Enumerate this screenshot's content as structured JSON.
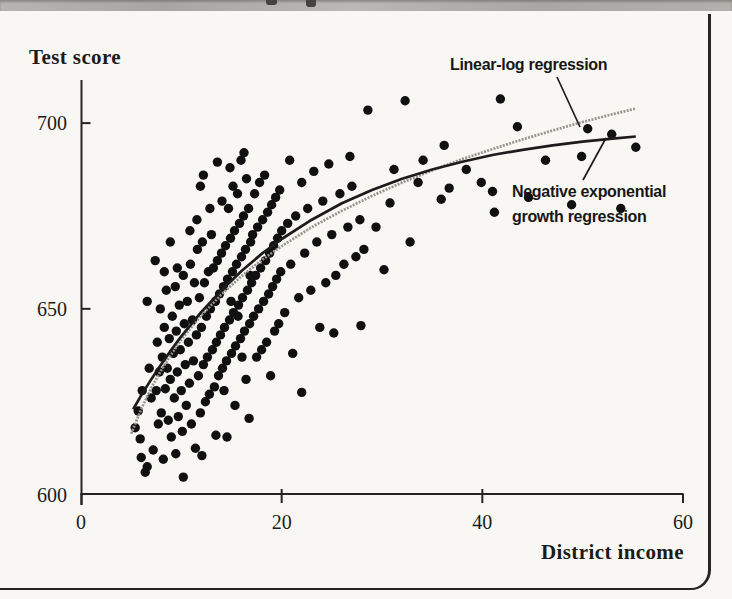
{
  "page": {
    "background_color": "#f8f7f3",
    "top_strip_color": "#aeaca8",
    "border_color": "#262523",
    "ink_color": "#1c1b19"
  },
  "chart_data": {
    "type": "scatter",
    "title": "",
    "xlabel": "District income",
    "ylabel": "Test score",
    "xlim": [
      0,
      60
    ],
    "ylim": [
      600,
      712
    ],
    "x_ticks": [
      0,
      20,
      40,
      60
    ],
    "y_ticks": [
      600,
      650,
      700
    ],
    "grid": false,
    "point_color": "#101010",
    "point_radius_px": 4.7,
    "annotations": {
      "linear_log_label": "Linear-log regression",
      "negexp_label_line1": "Negative exponential",
      "negexp_label_line2": "growth regression"
    },
    "curves": [
      {
        "name": "Linear-log regression",
        "color": "#97948d",
        "style": "stippled",
        "points": [
          [
            5,
            616.4
          ],
          [
            6,
            623.0
          ],
          [
            7,
            628.7
          ],
          [
            8,
            633.5
          ],
          [
            9,
            637.8
          ],
          [
            10,
            641.7
          ],
          [
            12,
            648.3
          ],
          [
            14,
            653.9
          ],
          [
            16,
            658.8
          ],
          [
            18,
            663.1
          ],
          [
            20,
            666.9
          ],
          [
            23,
            672.0
          ],
          [
            26,
            676.4
          ],
          [
            29,
            680.4
          ],
          [
            32,
            684.0
          ],
          [
            35,
            687.3
          ],
          [
            38,
            690.3
          ],
          [
            41,
            693.0
          ],
          [
            44,
            695.6
          ],
          [
            47,
            698.0
          ],
          [
            50,
            700.3
          ],
          [
            53,
            702.4
          ],
          [
            55.3,
            703.9
          ]
        ]
      },
      {
        "name": "Negative exponential growth regression",
        "color": "#1c1c1c",
        "style": "solid",
        "points": [
          [
            5.2,
            623.0
          ],
          [
            6,
            626.7
          ],
          [
            7,
            631.0
          ],
          [
            8,
            635.1
          ],
          [
            9,
            639.0
          ],
          [
            10,
            642.6
          ],
          [
            12,
            649.2
          ],
          [
            14,
            655.0
          ],
          [
            16,
            660.2
          ],
          [
            18,
            664.8
          ],
          [
            20,
            668.8
          ],
          [
            23,
            674.0
          ],
          [
            26,
            678.4
          ],
          [
            29,
            682.0
          ],
          [
            32,
            685.0
          ],
          [
            35,
            687.5
          ],
          [
            38,
            689.6
          ],
          [
            41,
            691.4
          ],
          [
            44,
            692.8
          ],
          [
            47,
            694.0
          ],
          [
            50,
            695.0
          ],
          [
            53,
            695.8
          ],
          [
            55.3,
            696.4
          ]
        ]
      }
    ],
    "points": [
      [
        5.4,
        618
      ],
      [
        5.7,
        622.5
      ],
      [
        5.9,
        615
      ],
      [
        6.0,
        610
      ],
      [
        6.1,
        628
      ],
      [
        6.4,
        606
      ],
      [
        6.6,
        607.5
      ],
      [
        6.8,
        634
      ],
      [
        7.0,
        626
      ],
      [
        7.2,
        612
      ],
      [
        8.2,
        609.5
      ],
      [
        10.2,
        604.7
      ],
      [
        7.5,
        628
      ],
      [
        7.6,
        641
      ],
      [
        7.7,
        619
      ],
      [
        7.8,
        633
      ],
      [
        7.9,
        650
      ],
      [
        8.0,
        622
      ],
      [
        8.1,
        637
      ],
      [
        8.3,
        645
      ],
      [
        8.4,
        628.5
      ],
      [
        8.5,
        655
      ],
      [
        8.6,
        634
      ],
      [
        8.7,
        620
      ],
      [
        8.8,
        642
      ],
      [
        8.9,
        631
      ],
      [
        9.0,
        615.5
      ],
      [
        9.1,
        648
      ],
      [
        9.2,
        638
      ],
      [
        9.3,
        626
      ],
      [
        9.4,
        656
      ],
      [
        9.5,
        644
      ],
      [
        9.6,
        633
      ],
      [
        9.7,
        621
      ],
      [
        9.8,
        651
      ],
      [
        9.9,
        639
      ],
      [
        10.0,
        628
      ],
      [
        10.2,
        659
      ],
      [
        10.3,
        646
      ],
      [
        10.4,
        635
      ],
      [
        10.1,
        617
      ],
      [
        9.45,
        611
      ],
      [
        7.4,
        663
      ],
      [
        8.9,
        668
      ],
      [
        9.6,
        661
      ],
      [
        8.3,
        660
      ],
      [
        6.6,
        652
      ],
      [
        10.5,
        624
      ],
      [
        10.6,
        652
      ],
      [
        10.7,
        641
      ],
      [
        10.8,
        630
      ],
      [
        10.9,
        662
      ],
      [
        11.0,
        619
      ],
      [
        11.1,
        647
      ],
      [
        11.2,
        636
      ],
      [
        11.3,
        657
      ],
      [
        11.4,
        612.5
      ],
      [
        11.5,
        643
      ],
      [
        11.6,
        666
      ],
      [
        11.7,
        632
      ],
      [
        11.8,
        653
      ],
      [
        11.9,
        622
      ],
      [
        12.0,
        645
      ],
      [
        12.1,
        668
      ],
      [
        12.2,
        635
      ],
      [
        12.3,
        657
      ],
      [
        12.4,
        625
      ],
      [
        12.5,
        648
      ],
      [
        12.6,
        637
      ],
      [
        12.7,
        660
      ],
      [
        12.8,
        627
      ],
      [
        12.9,
        650
      ],
      [
        13.0,
        670
      ],
      [
        13.1,
        639
      ],
      [
        13.2,
        661
      ],
      [
        13.3,
        629
      ],
      [
        13.4,
        652
      ],
      [
        13.5,
        641
      ],
      [
        13.6,
        663
      ],
      [
        13.7,
        632
      ],
      [
        13.8,
        654
      ],
      [
        13.9,
        643
      ],
      [
        12.05,
        610.5
      ],
      [
        11.55,
        674
      ],
      [
        12.85,
        677
      ],
      [
        10.85,
        671
      ],
      [
        13.45,
        616
      ],
      [
        14.0,
        665
      ],
      [
        14.1,
        634
      ],
      [
        14.2,
        656
      ],
      [
        14.3,
        645
      ],
      [
        14.4,
        667
      ],
      [
        14.5,
        636
      ],
      [
        14.6,
        658
      ],
      [
        14.7,
        677
      ],
      [
        14.8,
        647
      ],
      [
        14.9,
        669
      ],
      [
        15.0,
        638
      ],
      [
        15.1,
        660
      ],
      [
        15.2,
        649
      ],
      [
        15.3,
        671
      ],
      [
        15.4,
        640
      ],
      [
        15.5,
        662
      ],
      [
        15.6,
        681
      ],
      [
        15.7,
        651
      ],
      [
        15.8,
        673
      ],
      [
        15.9,
        642
      ],
      [
        16.0,
        664
      ],
      [
        16.1,
        653
      ],
      [
        16.2,
        675
      ],
      [
        16.3,
        644
      ],
      [
        16.4,
        666
      ],
      [
        16.5,
        685
      ],
      [
        16.6,
        655
      ],
      [
        16.7,
        677
      ],
      [
        16.8,
        646
      ],
      [
        16.9,
        668
      ],
      [
        17.0,
        657
      ],
      [
        14.25,
        628
      ],
      [
        15.35,
        624
      ],
      [
        16.45,
        631
      ],
      [
        14.85,
        688
      ],
      [
        15.95,
        690
      ],
      [
        16.75,
        620.5
      ],
      [
        14.55,
        615.5
      ],
      [
        15.15,
        683
      ],
      [
        16.05,
        637
      ],
      [
        14.05,
        679
      ],
      [
        16.85,
        659
      ],
      [
        15.65,
        648
      ],
      [
        14.95,
        652
      ],
      [
        16.25,
        692
      ],
      [
        17.1,
        670
      ],
      [
        17.2,
        648
      ],
      [
        17.3,
        681
      ],
      [
        17.4,
        659
      ],
      [
        17.5,
        637
      ],
      [
        17.6,
        672
      ],
      [
        17.7,
        650
      ],
      [
        17.8,
        684
      ],
      [
        17.9,
        661
      ],
      [
        18.0,
        639
      ],
      [
        18.1,
        674
      ],
      [
        18.2,
        652
      ],
      [
        18.3,
        686
      ],
      [
        18.4,
        663
      ],
      [
        18.5,
        641
      ],
      [
        18.6,
        676
      ],
      [
        18.7,
        654
      ],
      [
        18.8,
        665
      ],
      [
        18.9,
        632
      ],
      [
        19.0,
        678
      ],
      [
        19.1,
        656
      ],
      [
        19.2,
        667
      ],
      [
        19.3,
        644
      ],
      [
        19.4,
        680
      ],
      [
        19.5,
        658
      ],
      [
        19.6,
        669
      ],
      [
        19.7,
        646
      ],
      [
        19.8,
        682
      ],
      [
        19.9,
        660
      ],
      [
        20.0,
        671
      ],
      [
        12.2,
        686
      ],
      [
        13.6,
        689.5
      ],
      [
        11.9,
        683
      ],
      [
        20.3,
        649
      ],
      [
        20.6,
        673
      ],
      [
        20.8,
        690
      ],
      [
        20.9,
        662
      ],
      [
        21.1,
        638
      ],
      [
        21.4,
        675
      ],
      [
        21.7,
        653
      ],
      [
        22.0,
        627.5
      ],
      [
        22.0,
        684
      ],
      [
        22.3,
        665
      ],
      [
        22.6,
        677
      ],
      [
        22.9,
        655
      ],
      [
        23.2,
        687
      ],
      [
        23.5,
        668
      ],
      [
        23.8,
        645
      ],
      [
        24.1,
        679
      ],
      [
        24.4,
        657
      ],
      [
        24.7,
        689
      ],
      [
        25.0,
        670
      ],
      [
        25.2,
        643.5
      ],
      [
        25.4,
        659
      ],
      [
        25.8,
        681
      ],
      [
        26.2,
        662
      ],
      [
        26.6,
        672
      ],
      [
        26.8,
        691
      ],
      [
        27.0,
        683
      ],
      [
        27.4,
        664
      ],
      [
        27.8,
        674
      ],
      [
        28.2,
        666
      ],
      [
        28.6,
        703.5
      ],
      [
        32.3,
        706
      ],
      [
        41.8,
        706.5
      ],
      [
        43.5,
        699
      ],
      [
        50.5,
        698.5
      ],
      [
        52.9,
        697
      ],
      [
        55.3,
        693.5
      ],
      [
        49.9,
        691
      ],
      [
        46.3,
        690
      ],
      [
        36.2,
        694
      ],
      [
        34.1,
        690
      ],
      [
        31.2,
        687.5
      ],
      [
        33.6,
        684
      ],
      [
        36.7,
        682.5
      ],
      [
        38.4,
        687.5
      ],
      [
        39.9,
        684
      ],
      [
        44.6,
        680
      ],
      [
        48.9,
        678
      ],
      [
        53.8,
        677
      ],
      [
        30.8,
        678.5
      ],
      [
        35.9,
        679.5
      ],
      [
        41.2,
        676
      ],
      [
        29.4,
        672
      ],
      [
        32.8,
        668
      ],
      [
        30.2,
        660.5
      ],
      [
        27.9,
        645.5
      ]
    ]
  }
}
